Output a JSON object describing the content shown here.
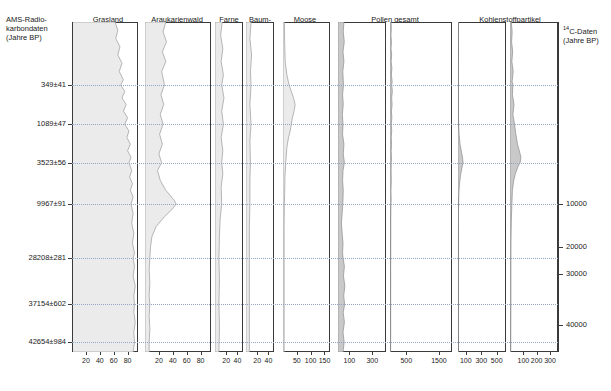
{
  "figure": {
    "left_header": "AMS-Radio-\nkarbondaten\n(Jahre BP)",
    "right_header": "14C-Daten\n(Jahre BP)",
    "right_header_sup": "14",
    "right_header_rest": "C-Daten\n(Jahre BP)"
  },
  "columns": [
    {
      "key": "grasland",
      "label": "Grasland",
      "sub": "",
      "ticks": [
        "20",
        "40",
        "60",
        "80"
      ]
    },
    {
      "key": "araukarienwald",
      "label": "Araukarienwald",
      "sub": "",
      "ticks": [
        "20",
        "40",
        "60",
        "80"
      ]
    },
    {
      "key": "farne",
      "label": "Farne",
      "sub": "",
      "ticks": [
        "20",
        "40"
      ]
    },
    {
      "key": "baumfarne",
      "label": "Baum-\nfarne",
      "sub": "",
      "ticks": [
        "20",
        "40"
      ]
    },
    {
      "key": "moose",
      "label": "Moose",
      "sub": "",
      "ticks": [
        "50",
        "100",
        "150"
      ]
    },
    {
      "key": "pollen_a",
      "label": "Pollen gesamt",
      "sub": "a",
      "ticks": [
        "100",
        "300"
      ]
    },
    {
      "key": "pollen_b",
      "label": "",
      "sub": "b",
      "ticks": [
        "500",
        "1500"
      ]
    },
    {
      "key": "kohle_a",
      "label": "Kohlenstoffpartikel",
      "sub": "a",
      "ticks": [
        "100",
        "300",
        "500"
      ]
    },
    {
      "key": "kohle_b",
      "label": "",
      "sub": "b",
      "ticks": [
        "100",
        "200",
        "300"
      ]
    }
  ],
  "left_dates": [
    {
      "label": "349±41",
      "depth_pct": 19.1
    },
    {
      "label": "1089±47",
      "depth_pct": 31.0
    },
    {
      "label": "3523±56",
      "depth_pct": 42.6
    },
    {
      "label": "9967±91",
      "depth_pct": 55.2
    },
    {
      "label": "28208±281",
      "depth_pct": 71.5
    },
    {
      "label": "37154±602",
      "depth_pct": 85.5
    },
    {
      "label": "42654±984",
      "depth_pct": 97.0
    }
  ],
  "right_dates": [
    {
      "label": "10000",
      "depth_pct": 55.2
    },
    {
      "label": "20000",
      "depth_pct": 68.2
    },
    {
      "label": "30000",
      "depth_pct": 76.4
    },
    {
      "label": "40000",
      "depth_pct": 91.8
    }
  ],
  "chart_data": {
    "type": "area",
    "orientation": "vertical-depth",
    "grid": true,
    "ylabel": "Tiefe / Alter (Jahre BP)",
    "ylim_pct": [
      0,
      100
    ],
    "gridlines_pct": [
      19.1,
      31.0,
      42.6,
      55.2,
      71.5,
      85.5,
      97.0
    ],
    "series": [
      {
        "name": "Grasland",
        "unit": "%",
        "xlim": [
          0,
          95
        ],
        "ticks": [
          20,
          40,
          60,
          80
        ],
        "points": [
          [
            0,
            62
          ],
          [
            2.5,
            66
          ],
          [
            5,
            63
          ],
          [
            7.5,
            69
          ],
          [
            10,
            66
          ],
          [
            12.5,
            72
          ],
          [
            15,
            68
          ],
          [
            17.5,
            74
          ],
          [
            19.1,
            70
          ],
          [
            21,
            76
          ],
          [
            23,
            72
          ],
          [
            25,
            78
          ],
          [
            27,
            74
          ],
          [
            29,
            80
          ],
          [
            31,
            76
          ],
          [
            33,
            82
          ],
          [
            35,
            79
          ],
          [
            37,
            84
          ],
          [
            39,
            80
          ],
          [
            41,
            85
          ],
          [
            42.6,
            82
          ],
          [
            45,
            86
          ],
          [
            47,
            83
          ],
          [
            49,
            87
          ],
          [
            51,
            84
          ],
          [
            53,
            88
          ],
          [
            55.2,
            85
          ],
          [
            58,
            88
          ],
          [
            61,
            86
          ],
          [
            64,
            89
          ],
          [
            67,
            87
          ],
          [
            70,
            90
          ],
          [
            71.5,
            88
          ],
          [
            74,
            90
          ],
          [
            77,
            88
          ],
          [
            80,
            91
          ],
          [
            83,
            89
          ],
          [
            85.5,
            90
          ],
          [
            88,
            89
          ],
          [
            91,
            91
          ],
          [
            94,
            89
          ],
          [
            97,
            90
          ],
          [
            100,
            88
          ]
        ]
      },
      {
        "name": "Araukarienwald",
        "unit": "%",
        "xlim": [
          0,
          95
        ],
        "ticks": [
          20,
          40,
          60,
          80
        ],
        "points": [
          [
            0,
            30
          ],
          [
            3,
            26
          ],
          [
            6,
            31
          ],
          [
            9,
            25
          ],
          [
            12,
            30
          ],
          [
            15,
            24
          ],
          [
            19.1,
            28
          ],
          [
            22,
            23
          ],
          [
            25,
            27
          ],
          [
            28,
            22
          ],
          [
            31,
            26
          ],
          [
            34,
            21
          ],
          [
            37,
            25
          ],
          [
            40,
            20
          ],
          [
            42.6,
            24
          ],
          [
            45,
            18
          ],
          [
            48,
            22
          ],
          [
            51,
            30
          ],
          [
            54,
            42
          ],
          [
            55.2,
            45
          ],
          [
            57,
            38
          ],
          [
            59,
            28
          ],
          [
            62,
            16
          ],
          [
            65,
            10
          ],
          [
            68,
            8
          ],
          [
            71.5,
            7
          ],
          [
            75,
            6
          ],
          [
            79,
            7
          ],
          [
            83,
            6
          ],
          [
            85.5,
            7
          ],
          [
            89,
            6
          ],
          [
            93,
            7
          ],
          [
            97,
            6
          ],
          [
            100,
            6
          ]
        ]
      },
      {
        "name": "Farne",
        "unit": "%",
        "xlim": [
          0,
          50
        ],
        "ticks": [
          20,
          40
        ],
        "points": [
          [
            0,
            13
          ],
          [
            4,
            10
          ],
          [
            8,
            14
          ],
          [
            12,
            11
          ],
          [
            16,
            15
          ],
          [
            19.1,
            12
          ],
          [
            23,
            16
          ],
          [
            27,
            12
          ],
          [
            31,
            15
          ],
          [
            35,
            11
          ],
          [
            39,
            14
          ],
          [
            42.6,
            12
          ],
          [
            46,
            14
          ],
          [
            50,
            11
          ],
          [
            55.2,
            12
          ],
          [
            60,
            9
          ],
          [
            65,
            8
          ],
          [
            71.5,
            7
          ],
          [
            78,
            8
          ],
          [
            85.5,
            7
          ],
          [
            92,
            8
          ],
          [
            100,
            7
          ]
        ]
      },
      {
        "name": "Baumfarne",
        "unit": "%",
        "xlim": [
          0,
          50
        ],
        "ticks": [
          20,
          40
        ],
        "points": [
          [
            0,
            9
          ],
          [
            5,
            7
          ],
          [
            10,
            10
          ],
          [
            15,
            8
          ],
          [
            19.1,
            9
          ],
          [
            25,
            7
          ],
          [
            31,
            9
          ],
          [
            36,
            7
          ],
          [
            42.6,
            8
          ],
          [
            48,
            7
          ],
          [
            55.2,
            7
          ],
          [
            62,
            6
          ],
          [
            71.5,
            6
          ],
          [
            80,
            6
          ],
          [
            85.5,
            6
          ],
          [
            93,
            6
          ],
          [
            100,
            6
          ]
        ]
      },
      {
        "name": "Moose",
        "unit": "Anzahl",
        "xlim": [
          0,
          170
        ],
        "ticks": [
          50,
          100,
          150
        ],
        "points": [
          [
            0,
            5
          ],
          [
            6,
            6
          ],
          [
            12,
            8
          ],
          [
            16,
            14
          ],
          [
            19.1,
            22
          ],
          [
            21,
            30
          ],
          [
            23,
            38
          ],
          [
            25,
            44
          ],
          [
            27,
            40
          ],
          [
            29,
            34
          ],
          [
            31,
            30
          ],
          [
            33,
            26
          ],
          [
            35,
            20
          ],
          [
            38,
            14
          ],
          [
            42.6,
            10
          ],
          [
            47,
            7
          ],
          [
            52,
            6
          ],
          [
            55.2,
            5
          ],
          [
            62,
            4
          ],
          [
            71.5,
            4
          ],
          [
            80,
            4
          ],
          [
            85.5,
            4
          ],
          [
            93,
            4
          ],
          [
            100,
            4
          ]
        ]
      },
      {
        "name": "Pollen gesamt a",
        "unit": "Anzahl",
        "xlim": [
          0,
          420
        ],
        "ticks": [
          100,
          300
        ],
        "points": [
          [
            0,
            52
          ],
          [
            3,
            46
          ],
          [
            6,
            55
          ],
          [
            9,
            44
          ],
          [
            12,
            52
          ],
          [
            15,
            42
          ],
          [
            19.1,
            48
          ],
          [
            22,
            40
          ],
          [
            25,
            46
          ],
          [
            28,
            38
          ],
          [
            31,
            44
          ],
          [
            34,
            40
          ],
          [
            37,
            52
          ],
          [
            40,
            46
          ],
          [
            42.6,
            56
          ],
          [
            45,
            44
          ],
          [
            48,
            40
          ],
          [
            51,
            46
          ],
          [
            55.2,
            42
          ],
          [
            58,
            36
          ],
          [
            61,
            30
          ],
          [
            64,
            36
          ],
          [
            67,
            44
          ],
          [
            70,
            40
          ],
          [
            71.5,
            44
          ],
          [
            74,
            56
          ],
          [
            77,
            48
          ],
          [
            80,
            60
          ],
          [
            83,
            50
          ],
          [
            85.5,
            58
          ],
          [
            88,
            46
          ],
          [
            91,
            56
          ],
          [
            94,
            44
          ],
          [
            97,
            54
          ],
          [
            100,
            44
          ]
        ]
      },
      {
        "name": "Pollen gesamt b",
        "unit": "Anzahl",
        "xlim": [
          0,
          1900
        ],
        "ticks": [
          500,
          1500
        ],
        "points": [
          [
            0,
            34
          ],
          [
            2,
            40
          ],
          [
            4,
            30
          ],
          [
            6,
            44
          ],
          [
            8,
            32
          ],
          [
            10,
            50
          ],
          [
            12,
            36
          ],
          [
            14,
            58
          ],
          [
            16,
            42
          ],
          [
            18,
            66
          ],
          [
            19.1,
            52
          ],
          [
            21,
            72
          ],
          [
            23,
            50
          ],
          [
            25,
            64
          ],
          [
            27,
            44
          ],
          [
            29,
            56
          ],
          [
            31,
            40
          ],
          [
            33,
            52
          ],
          [
            35,
            38
          ],
          [
            37,
            50
          ],
          [
            39,
            36
          ],
          [
            41,
            46
          ],
          [
            42.6,
            40
          ],
          [
            45,
            34
          ],
          [
            48,
            40
          ],
          [
            51,
            30
          ],
          [
            54,
            36
          ],
          [
            55.2,
            30
          ],
          [
            58,
            26
          ],
          [
            61,
            22
          ],
          [
            64,
            26
          ],
          [
            67,
            22
          ],
          [
            70,
            24
          ],
          [
            71.5,
            22
          ],
          [
            75,
            20
          ],
          [
            79,
            22
          ],
          [
            83,
            20
          ],
          [
            85.5,
            22
          ],
          [
            89,
            20
          ],
          [
            93,
            22
          ],
          [
            97,
            20
          ],
          [
            100,
            18
          ]
        ]
      },
      {
        "name": "Kohlenstoffpartikel a",
        "unit": "Anzahl",
        "xlim": [
          0,
          620
        ],
        "ticks": [
          100,
          300,
          500
        ],
        "points": [
          [
            0,
            4
          ],
          [
            5,
            5
          ],
          [
            10,
            4
          ],
          [
            15,
            6
          ],
          [
            19.1,
            5
          ],
          [
            24,
            6
          ],
          [
            28,
            5
          ],
          [
            31,
            8
          ],
          [
            34,
            14
          ],
          [
            37,
            26
          ],
          [
            39,
            42
          ],
          [
            41,
            58
          ],
          [
            42.6,
            66
          ],
          [
            44,
            52
          ],
          [
            46,
            36
          ],
          [
            48,
            24
          ],
          [
            50,
            16
          ],
          [
            53,
            10
          ],
          [
            55.2,
            8
          ],
          [
            60,
            6
          ],
          [
            65,
            5
          ],
          [
            71.5,
            5
          ],
          [
            78,
            5
          ],
          [
            85.5,
            5
          ],
          [
            93,
            5
          ],
          [
            100,
            4
          ]
        ]
      },
      {
        "name": "Kohlenstoffpartikel b",
        "unit": "Anzahl",
        "xlim": [
          0,
          360
        ],
        "ticks": [
          100,
          200,
          300
        ],
        "points": [
          [
            0,
            10
          ],
          [
            3,
            16
          ],
          [
            6,
            12
          ],
          [
            9,
            20
          ],
          [
            12,
            14
          ],
          [
            15,
            24
          ],
          [
            18,
            16
          ],
          [
            19.1,
            22
          ],
          [
            22,
            18
          ],
          [
            25,
            30
          ],
          [
            28,
            22
          ],
          [
            31,
            34
          ],
          [
            34,
            44
          ],
          [
            37,
            56
          ],
          [
            39,
            70
          ],
          [
            41,
            82
          ],
          [
            42.6,
            76
          ],
          [
            44,
            58
          ],
          [
            46,
            40
          ],
          [
            48,
            28
          ],
          [
            51,
            18
          ],
          [
            55.2,
            14
          ],
          [
            60,
            10
          ],
          [
            65,
            8
          ],
          [
            71.5,
            7
          ],
          [
            78,
            7
          ],
          [
            85.5,
            7
          ],
          [
            93,
            6
          ],
          [
            100,
            6
          ]
        ]
      }
    ]
  }
}
